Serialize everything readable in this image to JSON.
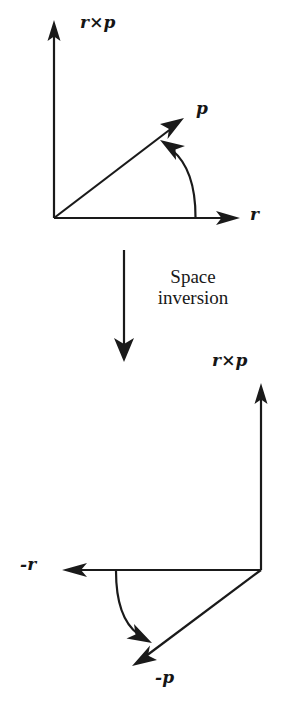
{
  "figure": {
    "background_color": "#ffffff",
    "stroke_color": "#1a1a1a",
    "text_color": "#181818"
  },
  "caption": {
    "line1": "Space",
    "line2": "inversion",
    "full": "Space inversion"
  },
  "top_diagram": {
    "name": "before-inversion",
    "labels": {
      "cross_product": "r×p",
      "momentum": "p",
      "position": "r"
    },
    "vectors": [
      {
        "name": "r-cross-p-axis",
        "label": "r×p",
        "direction": "up",
        "from": [
          54,
          218
        ],
        "to": [
          54,
          22
        ]
      },
      {
        "name": "r-axis",
        "label": "r",
        "direction": "right",
        "from": [
          54,
          218
        ],
        "to": [
          240,
          218
        ]
      },
      {
        "name": "p-vector",
        "label": "p",
        "direction": "up-right",
        "from": [
          54,
          218
        ],
        "to": [
          183,
          119
        ]
      }
    ],
    "rotation_arc": {
      "name": "rotation-sense-arc",
      "from": [
        196,
        216
      ],
      "to": [
        163,
        144
      ],
      "direction": "counterclockwise-toward-p"
    }
  },
  "bottom_diagram": {
    "name": "after-inversion",
    "labels": {
      "cross_product": "r×p",
      "momentum": "-p",
      "position": "-r"
    },
    "vectors": [
      {
        "name": "r-cross-p-axis",
        "label": "r×p",
        "direction": "up",
        "from": [
          261,
          570
        ],
        "to": [
          261,
          385
        ]
      },
      {
        "name": "neg-r-axis",
        "label": "-r",
        "direction": "left",
        "from": [
          261,
          570
        ],
        "to": [
          62,
          570
        ]
      },
      {
        "name": "neg-p-vector",
        "label": "-p",
        "direction": "down-left",
        "from": [
          261,
          570
        ],
        "to": [
          133,
          665
        ]
      }
    ],
    "rotation_arc": {
      "name": "rotation-sense-arc",
      "from": [
        116,
        572
      ],
      "to": [
        150,
        640
      ],
      "direction": "clockwise-toward-neg-p"
    }
  },
  "transition": {
    "name": "space-inversion-arrow",
    "direction": "down",
    "from": [
      124,
      250
    ],
    "to": [
      124,
      360
    ]
  }
}
